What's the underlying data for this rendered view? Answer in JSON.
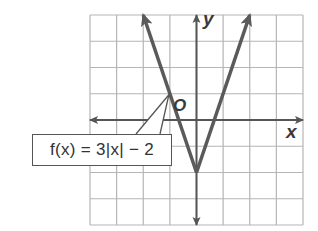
{
  "chart_data": {
    "type": "line",
    "title": "",
    "function_label": "f(x) = 3|x| − 2",
    "xlabel": "x",
    "ylabel": "y",
    "origin_label": "O",
    "xlim": [
      -4,
      4
    ],
    "ylim": [
      -4,
      4
    ],
    "grid": true,
    "grid_step": 1,
    "series": [
      {
        "name": "f(x) = 3|x| - 2",
        "x": [
          -2,
          -1,
          0,
          1,
          2
        ],
        "y": [
          4,
          1,
          -2,
          1,
          4
        ],
        "vertex": [
          0,
          -2
        ],
        "arrows_at_ends": true
      }
    ],
    "colors": {
      "grid": "#b5b5b5",
      "axes": "#555555",
      "graph_line": "#5a5a5a"
    }
  }
}
